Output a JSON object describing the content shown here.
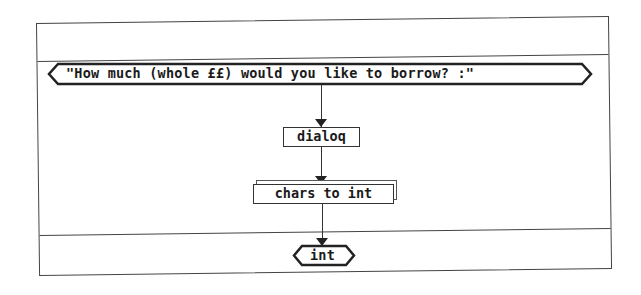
{
  "diagram": {
    "type": "flowchart",
    "input_terminal": {
      "label": "\"How much (whole ££) would you like to borrow? :\""
    },
    "nodes": [
      {
        "id": "dialog",
        "label": "dialoq",
        "shape": "rectangle"
      },
      {
        "id": "chars_to_int",
        "label": "chars to int",
        "shape": "stacked-rectangle"
      }
    ],
    "output_terminal": {
      "label": "int"
    },
    "edges": [
      {
        "from": "input_terminal",
        "to": "dialog"
      },
      {
        "from": "dialog",
        "to": "chars_to_int"
      },
      {
        "from": "chars_to_int",
        "to": "output_terminal"
      }
    ]
  }
}
